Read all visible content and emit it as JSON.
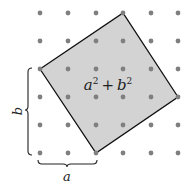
{
  "diagram": {
    "colors": {
      "fill": "#d3d3d3",
      "stroke": "#111111",
      "dot": "#7f7f7f",
      "brace": "#222222"
    },
    "grid": {
      "xs": [
        40,
        68,
        96,
        123,
        151,
        178
      ],
      "ys": [
        13,
        41,
        69,
        97,
        125,
        153
      ],
      "dot_radius": 2.4
    },
    "square": {
      "vertices": [
        [
          40,
          69
        ],
        [
          123,
          13
        ],
        [
          178,
          97
        ],
        [
          96,
          153
        ]
      ]
    },
    "labels": {
      "area_base_a": "a",
      "area_exp_a": "2",
      "area_plus": "+",
      "area_base_b": "b",
      "area_exp_b": "2",
      "side_a": "a",
      "side_b": "b"
    }
  }
}
